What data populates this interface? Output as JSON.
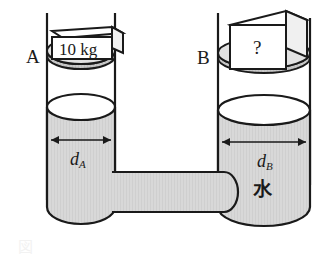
{
  "figure": {
    "kind": "physics-diagram",
    "background_color": "#ffffff",
    "line_color": "#1a1a1a",
    "water_fill_color": "#d6d6d6",
    "piston_fill_color": "#c9c9c9",
    "block_face_color": "#ffffff"
  },
  "labels": {
    "vessel_a": "A",
    "vessel_b": "B",
    "block_a_mass": "10 kg",
    "block_b_unknown": "?",
    "diameter_a": "d",
    "diameter_a_sub": "A",
    "diameter_b": "d",
    "diameter_b_sub": "B",
    "water": "水",
    "caption_partial": "図"
  }
}
